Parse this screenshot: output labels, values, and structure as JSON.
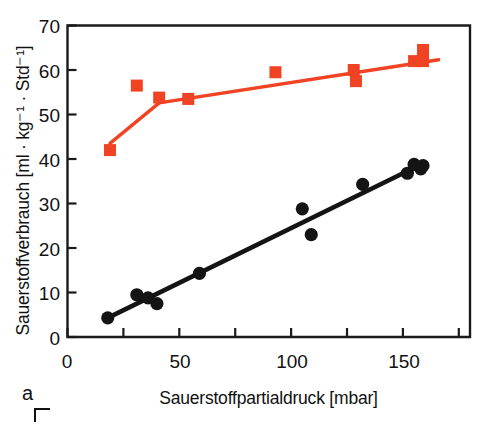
{
  "figure": {
    "panel_label": "a",
    "ylabel": "Sauerstoffverbrauch [ml · kg⁻¹ · Std⁻¹]",
    "xlabel": "Sauerstoffpartialdruck [mbar]"
  },
  "colors": {
    "series_red": "#f04323",
    "series_black": "#141414",
    "axis": "#1a1a1a",
    "background": "#ffffff"
  },
  "axes": {
    "y_ticks": [
      0,
      10,
      20,
      30,
      40,
      50,
      60,
      70
    ],
    "y_tick_labels": [
      "0",
      "10",
      "20",
      "30",
      "40",
      "50",
      "60",
      "70"
    ],
    "x_ticks": [
      0,
      25,
      50,
      75,
      100,
      125,
      150,
      175
    ],
    "x_tick_labels": [
      "0",
      "",
      "50",
      "",
      "100",
      "",
      "150",
      ""
    ],
    "xlim": [
      0,
      180
    ],
    "ylim": [
      0,
      70
    ]
  },
  "chart_data": {
    "type": "scatter",
    "title": "",
    "xlabel": "Sauerstoffpartialdruck [mbar]",
    "ylabel": "Sauerstoffverbrauch [ml · kg⁻¹ · Std⁻¹]",
    "xlim": [
      0,
      180
    ],
    "ylim": [
      0,
      70
    ],
    "xticks": [
      0,
      25,
      50,
      75,
      100,
      125,
      150,
      175
    ],
    "yticks": [
      0,
      10,
      20,
      30,
      40,
      50,
      60,
      70
    ],
    "grid": false,
    "legend": "none",
    "series": [
      {
        "name": "obere Kurve (rote Quadrate)",
        "marker": "square",
        "color": "#f04323",
        "points": [
          {
            "x": 19,
            "y": 42.0
          },
          {
            "x": 31,
            "y": 56.5
          },
          {
            "x": 41,
            "y": 53.8
          },
          {
            "x": 54,
            "y": 53.5
          },
          {
            "x": 93,
            "y": 59.5
          },
          {
            "x": 128,
            "y": 60.0
          },
          {
            "x": 129,
            "y": 57.5
          },
          {
            "x": 155,
            "y": 62.0
          },
          {
            "x": 159,
            "y": 64.5
          },
          {
            "x": 159,
            "y": 62.0
          }
        ],
        "fit_line": [
          {
            "x": 19,
            "y": 43.5
          },
          {
            "x": 41,
            "y": 52.6
          },
          {
            "x": 166,
            "y": 62.3
          }
        ]
      },
      {
        "name": "untere Kurve (schwarze Kreise)",
        "marker": "circle",
        "color": "#141414",
        "points": [
          {
            "x": 18,
            "y": 4.3
          },
          {
            "x": 31,
            "y": 9.5
          },
          {
            "x": 36,
            "y": 8.8
          },
          {
            "x": 40,
            "y": 7.5
          },
          {
            "x": 59,
            "y": 14.3
          },
          {
            "x": 105,
            "y": 28.8
          },
          {
            "x": 109,
            "y": 23.0
          },
          {
            "x": 132,
            "y": 34.3
          },
          {
            "x": 152,
            "y": 36.8
          },
          {
            "x": 155,
            "y": 38.8
          },
          {
            "x": 158,
            "y": 37.8
          },
          {
            "x": 159,
            "y": 38.5
          }
        ],
        "fit_line": [
          {
            "x": 18,
            "y": 4.3
          },
          {
            "x": 159,
            "y": 39.0
          }
        ]
      }
    ]
  }
}
